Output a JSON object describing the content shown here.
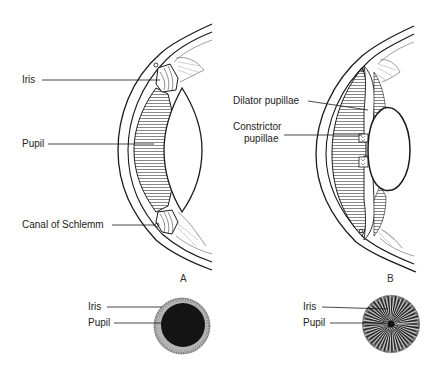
{
  "figure": {
    "panels": [
      {
        "id": "A",
        "panel_label": "A",
        "state": "dilated",
        "section_labels": [
          "Iris",
          "Pupil",
          "Canal of Schlemm"
        ],
        "front_view_labels": [
          "Iris",
          "Pupil"
        ]
      },
      {
        "id": "B",
        "panel_label": "B",
        "state": "constricted",
        "section_labels": [
          "Dilator pupillae",
          "Constrictor",
          "pupillae"
        ],
        "front_view_labels": [
          "Iris",
          "Pupil"
        ]
      }
    ]
  },
  "colors": {
    "ink": "#1a1a1a",
    "hatch": "#8a8a8a",
    "pupil_dark": "#141414",
    "iris_speckle": "#9a9a9a"
  }
}
